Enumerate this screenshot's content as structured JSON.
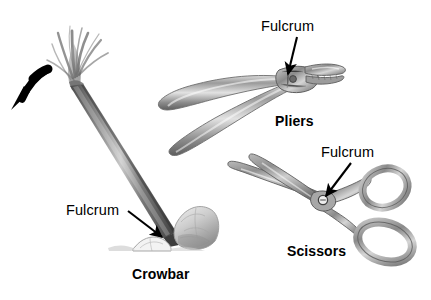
{
  "diagram": {
    "title_text_present": false,
    "background_color": "#ffffff",
    "ink_color": "#000000",
    "sketch_tone": "#8a8a8a",
    "tools": [
      {
        "id": "crowbar",
        "name_label": "Crowbar",
        "fulcrum_label": "Fulcrum",
        "description": "Crowbar prying a large rock, resting on a small fulcrum stone, with a curved motion arrow at the handle end"
      },
      {
        "id": "pliers",
        "name_label": "Pliers",
        "fulcrum_label": "Fulcrum",
        "description": "Open pliers with jaws at right and handles extending to the lower left; fulcrum at the hinge pin"
      },
      {
        "id": "scissors",
        "name_label": "Scissors",
        "fulcrum_label": "Fulcrum",
        "description": "Open scissors with blades to the upper left and two finger loops to the right; fulcrum at the pivot screw"
      }
    ],
    "annotations": {
      "arrow_color": "#000000",
      "motion_arrow": "curved arrow showing crowbar handle pushed down and to the left"
    }
  }
}
